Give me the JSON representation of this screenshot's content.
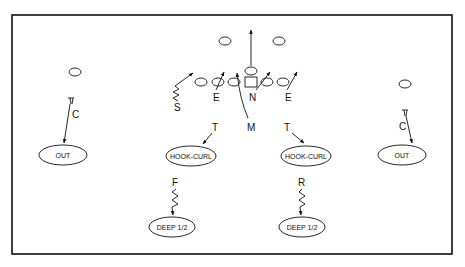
{
  "diagram": {
    "type": "football-defensive-coverage",
    "frame": {
      "x": 12,
      "y": 15,
      "w": 440,
      "h": 239,
      "color": "#111111"
    },
    "offense": {
      "line": [
        {
          "id": "lt",
          "x": 201,
          "y": 82
        },
        {
          "id": "lg",
          "x": 218,
          "y": 82
        },
        {
          "id": "center",
          "x": 234,
          "y": 82
        },
        {
          "id": "rg",
          "x": 266,
          "y": 82
        },
        {
          "id": "rt",
          "x": 283,
          "y": 82
        }
      ],
      "snap_square": {
        "x": 251,
        "y": 82
      },
      "qb": {
        "x": 251,
        "y": 71
      },
      "backs": [
        {
          "x": 225,
          "y": 41
        },
        {
          "x": 279,
          "y": 41
        }
      ],
      "receivers": [
        {
          "x": 75,
          "y": 72
        },
        {
          "x": 405,
          "y": 84
        }
      ]
    },
    "defenders": [
      {
        "label": "S",
        "x": 178,
        "y": 107
      },
      {
        "label": "E",
        "x": 217,
        "y": 98
      },
      {
        "label": "N",
        "x": 254,
        "y": 98
      },
      {
        "label": "E",
        "x": 289,
        "y": 98
      },
      {
        "label": "M",
        "x": 252,
        "y": 128
      },
      {
        "label": "T",
        "x": 216,
        "y": 129
      },
      {
        "label": "T",
        "x": 288,
        "y": 129
      },
      {
        "label": "C",
        "x": 71,
        "y": 115
      },
      {
        "label": "C",
        "x": 402,
        "y": 127
      },
      {
        "label": "F",
        "x": 177,
        "y": 184
      },
      {
        "label": "R",
        "x": 302,
        "y": 184
      }
    ],
    "zones": [
      {
        "label": "OUT",
        "x": 63,
        "y": 155,
        "rx": 24,
        "ry": 10
      },
      {
        "label": "HOOK-CURL",
        "x": 191,
        "y": 156,
        "rx": 25,
        "ry": 10
      },
      {
        "label": "HOOK-CURL",
        "x": 306,
        "y": 156,
        "rx": 25,
        "ry": 10
      },
      {
        "label": "OUT",
        "x": 402,
        "y": 155,
        "rx": 24,
        "ry": 10
      },
      {
        "label": "DEEP 1/2",
        "x": 172,
        "y": 227,
        "rx": 23,
        "ry": 10
      },
      {
        "label": "DEEP 1/2",
        "x": 302,
        "y": 227,
        "rx": 23,
        "ry": 10
      }
    ]
  }
}
